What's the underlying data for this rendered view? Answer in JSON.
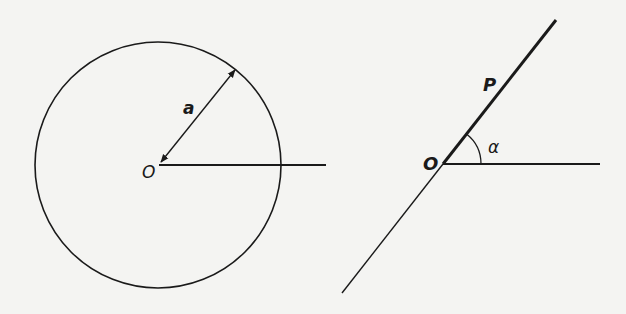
{
  "figures": [
    {
      "id": "circle-figure",
      "labels": {
        "origin": "O",
        "radius": "a"
      },
      "center": [
        158,
        165
      ],
      "radius_px": 123
    },
    {
      "id": "ray-figure",
      "labels": {
        "origin": "O",
        "point": "P",
        "angle": "α"
      },
      "origin": [
        443,
        164
      ]
    }
  ],
  "colors": {
    "stroke": "#1a1a1a",
    "background": "#f4f4f2"
  }
}
